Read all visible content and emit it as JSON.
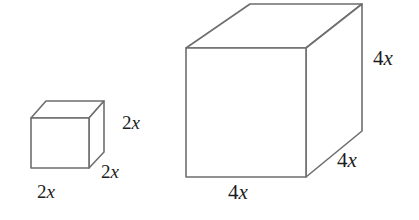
{
  "figure": {
    "type": "geometry-diagram",
    "background_color": "#ffffff",
    "edge_color": "#6e6e6e",
    "label_color": "#1d1d1d"
  },
  "shapes": [
    {
      "id": "small-cube",
      "name": "small cube",
      "edge_length": "2x",
      "labels": {
        "width": {
          "coefficient": "2",
          "variable": "x"
        },
        "depth": {
          "coefficient": "2",
          "variable": "x"
        },
        "height": {
          "coefficient": "2",
          "variable": "x"
        }
      }
    },
    {
      "id": "large-cube",
      "name": "large cube",
      "edge_length": "4x",
      "labels": {
        "width": {
          "coefficient": "4",
          "variable": "x"
        },
        "depth": {
          "coefficient": "4",
          "variable": "x"
        },
        "height": {
          "coefficient": "4",
          "variable": "x"
        }
      }
    }
  ]
}
